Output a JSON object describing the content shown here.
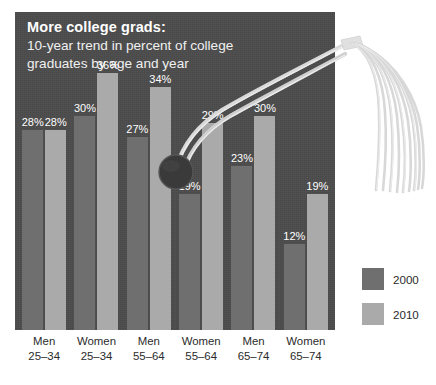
{
  "figure": {
    "title_main": "More college grads:",
    "title_sub_line1": "10-year trend in percent of college",
    "title_sub_line2": "graduates by age and year",
    "panel_color": "#4b4b4b",
    "decoration": "graduation-cap-tassel"
  },
  "legend": {
    "items": [
      {
        "label": "2000",
        "color": "#6f6f6f"
      },
      {
        "label": "2010",
        "color": "#aaaaaa"
      }
    ]
  },
  "chart_data": {
    "type": "bar",
    "title": "More college grads: 10-year trend in percent of college graduates by age and year",
    "xlabel": "",
    "ylabel": "",
    "ylim": [
      0,
      40
    ],
    "grid": false,
    "legend_position": "right",
    "value_suffix": "%",
    "categories": [
      {
        "line1": "Men",
        "line2": "25–34"
      },
      {
        "line1": "Women",
        "line2": "25–34"
      },
      {
        "line1": "Men",
        "line2": "55–64"
      },
      {
        "line1": "Women",
        "line2": "55–64"
      },
      {
        "line1": "Men",
        "line2": "65–74"
      },
      {
        "line1": "Women",
        "line2": "65–74"
      }
    ],
    "series": [
      {
        "name": "2000",
        "color": "#6f6f6f",
        "values": [
          28,
          30,
          27,
          19,
          23,
          12
        ],
        "labels": [
          "28%",
          "30%",
          "27%",
          "19%",
          "23%",
          "12%"
        ]
      },
      {
        "name": "2010",
        "color": "#aaaaaa",
        "values": [
          28,
          36,
          34,
          29,
          30,
          19
        ],
        "labels": [
          "28%",
          "36%",
          "34%",
          "29%",
          "30%",
          "19%"
        ]
      }
    ]
  }
}
